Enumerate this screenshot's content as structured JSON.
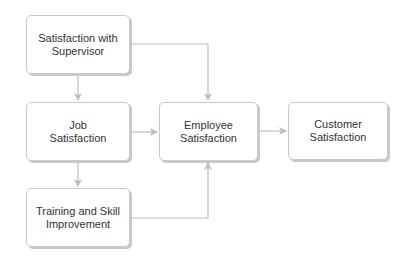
{
  "nodes": {
    "supervisor": "Satisfaction with Supervisor",
    "job": "Job Satisfaction",
    "training": "Training and Skill Improvement",
    "employee": "Employee Satisfaction",
    "customer": "Customer Satisfaction"
  },
  "edges": [
    {
      "from": "supervisor",
      "to": "job"
    },
    {
      "from": "supervisor",
      "to": "employee"
    },
    {
      "from": "job",
      "to": "employee"
    },
    {
      "from": "job",
      "to": "training"
    },
    {
      "from": "training",
      "to": "employee"
    },
    {
      "from": "employee",
      "to": "customer"
    }
  ],
  "colors": {
    "line": "#bdbdbd",
    "border": "#c9c9c9",
    "text": "#333333"
  }
}
